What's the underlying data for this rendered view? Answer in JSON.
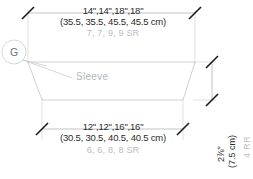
{
  "diagram": {
    "piece_label": "Sleeve",
    "callout": {
      "letter": "G"
    },
    "colors": {
      "outline": "#c9cccf",
      "dimension_line": "#a8abae",
      "tick": "#1a1a1a",
      "text": "#2b2b2b",
      "muted_text": "#b9bcbf",
      "background": "#ffffff"
    },
    "top_dimension": {
      "inches": "14\",14\",18\",18\"",
      "centimeters": "(35.5, 35.5, 45.5, 45.5 cm)",
      "stitch_repeats": "7, 7, 9, 9 SR"
    },
    "bottom_dimension": {
      "inches": "12\",12\",16\",16\"",
      "centimeters": "(30.5, 30.5, 40.5, 40.5 cm)",
      "stitch_repeats": "6, 6, 8, 8 SR"
    },
    "right_dimension": {
      "inches": "2⅞\"",
      "centimeters": "(7.5 cm)",
      "row_repeats": "4 RR"
    }
  }
}
